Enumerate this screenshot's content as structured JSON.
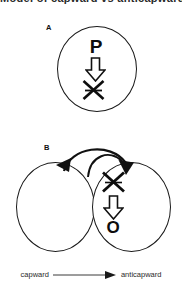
{
  "figure": {
    "title": "Model of capward vs anticapward",
    "background_color": "#ffffff",
    "stroke_color": "#1a1a1a"
  },
  "panels": [
    {
      "label": "A",
      "description": "single cell with P converted to crossed-out species",
      "cells": [
        {
          "name": "cell-a",
          "contents": [
            "P",
            "down-arrow",
            "x-crossed-symbol"
          ]
        }
      ],
      "glyphs": {
        "substrate": "P",
        "arrow": "down-block-arrow",
        "product": "x-crossed-symbol"
      }
    },
    {
      "label": "B",
      "description": "two adjacent cells with bidirectional transfer arrow; right cell converts crossed species to O",
      "cells": [
        {
          "name": "cell-b-left",
          "contents": []
        },
        {
          "name": "cell-b-right",
          "contents": [
            "x-crossed-symbol",
            "down-arrow",
            "O"
          ]
        }
      ],
      "glyphs": {
        "substrate": "x-crossed-symbol",
        "arrow": "down-block-arrow",
        "product": "O"
      },
      "transfer_arrows": [
        "curved-arrow-left",
        "curved-arrow-right"
      ]
    }
  ],
  "legend": {
    "left_label": "capward",
    "arrow": "rightwards-arrow",
    "right_label": "anticapward"
  }
}
